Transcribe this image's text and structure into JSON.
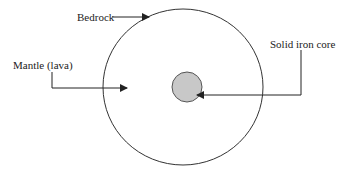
{
  "diagram": {
    "labels": {
      "bedrock": "Bedrock",
      "mantle": "Mantle (lava)",
      "core": "Solid iron core"
    },
    "colors": {
      "outline": "#333333",
      "core_fill": "#c8c8c8",
      "background": "#ffffff"
    }
  }
}
